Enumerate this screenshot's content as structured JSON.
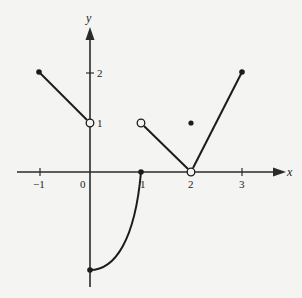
{
  "figure": {
    "type": "piecewise-function-graph",
    "axes": {
      "x_label": "x",
      "y_label": "y",
      "origin_label": "0",
      "x_ticks": [
        {
          "value": -1,
          "label": "−1"
        },
        {
          "value": 1,
          "label": "1"
        },
        {
          "value": 2,
          "label": "2"
        },
        {
          "value": 3,
          "label": "3"
        }
      ],
      "y_ticks": [
        {
          "value": 1,
          "label": "1"
        },
        {
          "value": 2,
          "label": "2"
        }
      ]
    },
    "segments": [
      {
        "kind": "line",
        "from": [
          -1,
          2
        ],
        "to": [
          0,
          1
        ],
        "start": "closed",
        "end": "open"
      },
      {
        "kind": "curve",
        "from": [
          0,
          -2
        ],
        "to": [
          1,
          0
        ],
        "start": "closed",
        "end": "closed",
        "shape": "concave-up arc"
      },
      {
        "kind": "line",
        "from": [
          1,
          1
        ],
        "to": [
          2,
          0
        ],
        "start": "open",
        "end": "open"
      },
      {
        "kind": "line",
        "from": [
          2,
          0
        ],
        "to": [
          3,
          2
        ],
        "start": "open",
        "end": "closed"
      }
    ],
    "isolated_points": [
      {
        "at": [
          2,
          1
        ],
        "style": "closed"
      }
    ],
    "colors": {
      "background": "#f4f4f2",
      "ink": "#1c1c1c"
    }
  }
}
